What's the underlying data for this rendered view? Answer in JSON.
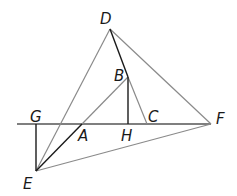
{
  "diagram": {
    "type": "geometry-figure",
    "points": {
      "D": {
        "label": "D",
        "x": 110,
        "y": 29
      },
      "B": {
        "label": "B",
        "x": 128,
        "y": 77
      },
      "C": {
        "label": "C",
        "x": 147,
        "y": 124
      },
      "H": {
        "label": "H",
        "x": 128,
        "y": 124
      },
      "A": {
        "label": "A",
        "x": 82,
        "y": 124
      },
      "G": {
        "label": "G",
        "x": 36,
        "y": 124
      },
      "F": {
        "label": "F",
        "x": 211,
        "y": 124
      },
      "E": {
        "label": "E",
        "x": 36,
        "y": 171
      }
    },
    "segments": [
      {
        "from": "baseline-left",
        "to": "F",
        "note": "horizontal line through G, A, H, C"
      },
      {
        "from": "D",
        "to": "E"
      },
      {
        "from": "D",
        "to": "F"
      },
      {
        "from": "D",
        "to": "B"
      },
      {
        "from": "B",
        "to": "C"
      },
      {
        "from": "B",
        "to": "A"
      },
      {
        "from": "A",
        "to": "E"
      },
      {
        "from": "B",
        "to": "H"
      },
      {
        "from": "G",
        "to": "E"
      },
      {
        "from": "E",
        "to": "F"
      }
    ],
    "colors": {
      "dark_line": "#1a1a1a",
      "gray_line": "#808080"
    }
  }
}
